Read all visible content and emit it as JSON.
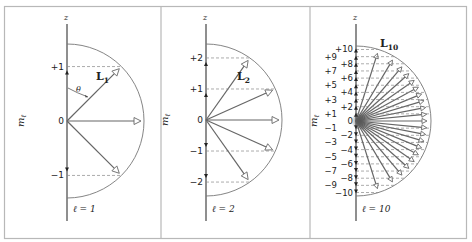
{
  "figure": {
    "axis_label": "z",
    "ordinate_label": "m",
    "ordinate_subscript": "ℓ",
    "angle_label": "θ",
    "colors": {
      "frame": "#b8b8b8",
      "axis": "#333333",
      "vector": "#666666",
      "arc": "#777777",
      "dash": "#888888"
    }
  },
  "panels": [
    {
      "id": "l1",
      "l_value": 1,
      "l_label": "ℓ = 1",
      "vector_label": "L",
      "vector_subscript": "1",
      "m_values": [
        1,
        0,
        -1
      ],
      "m_labels": [
        "+1",
        "0",
        "−1"
      ],
      "show_theta": true
    },
    {
      "id": "l2",
      "l_value": 2,
      "l_label": "ℓ = 2",
      "vector_label": "L",
      "vector_subscript": "2",
      "m_values": [
        2,
        1,
        0,
        -1,
        -2
      ],
      "m_labels": [
        "+2",
        "+1",
        "0",
        "−1",
        "−2"
      ],
      "show_theta": false
    },
    {
      "id": "l10",
      "l_value": 10,
      "l_label": "ℓ = 10",
      "vector_label": "L",
      "vector_subscript": "10",
      "m_values": [
        10,
        9,
        8,
        7,
        6,
        5,
        4,
        3,
        2,
        1,
        0,
        -1,
        -2,
        -3,
        -4,
        -5,
        -6,
        -7,
        -8,
        -9,
        -10
      ],
      "m_labels": [
        "+10",
        "+9",
        "+8",
        "+7",
        "+6",
        "+5",
        "+4",
        "+3",
        "+2",
        "+1",
        "0",
        "−1",
        "−2",
        "−3",
        "−4",
        "−5",
        "−6",
        "−7",
        "−8",
        "−9",
        "−10"
      ],
      "show_theta": false
    }
  ]
}
